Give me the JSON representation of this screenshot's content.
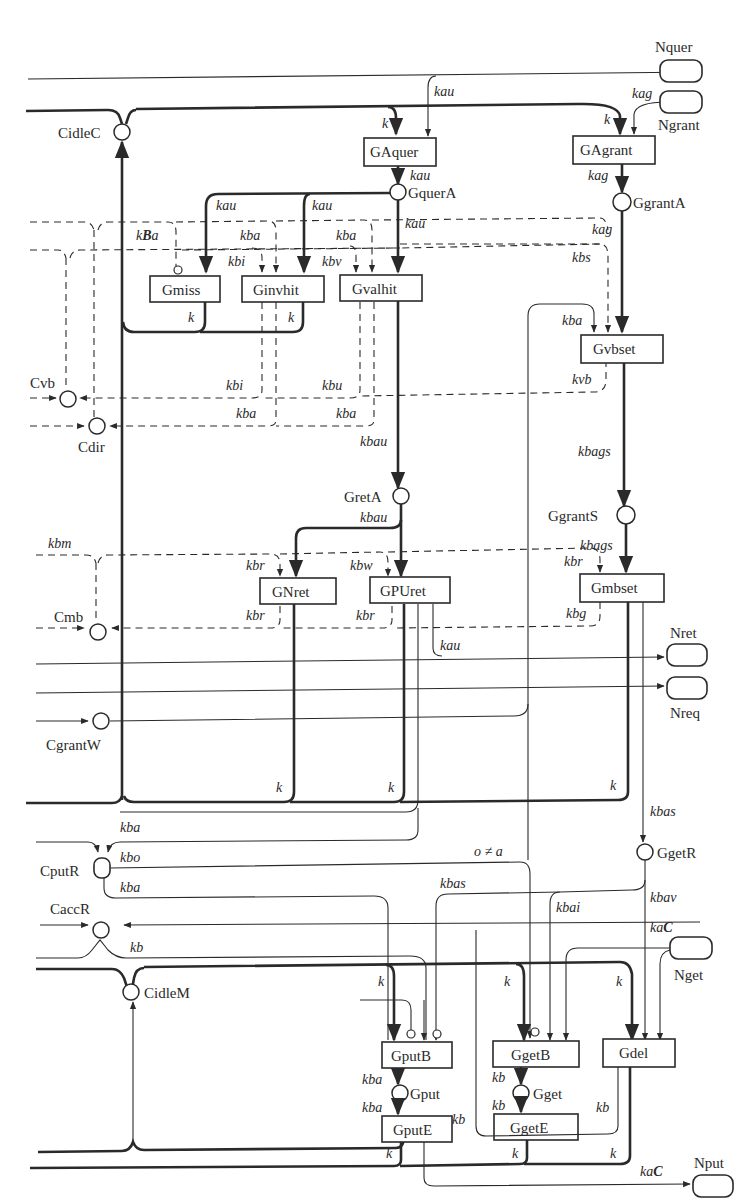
{
  "diagram": {
    "type": "petri-net",
    "places": {
      "CidleC": "CidleC",
      "GquerA": "GquerA",
      "GgrantA": "GgrantA",
      "Cvb": "Cvb",
      "Cdir": "Cdir",
      "GretA": "GretA",
      "GgrantS": "GgrantS",
      "Cmb": "Cmb",
      "CgrantW": "CgrantW",
      "CputR": "CputR",
      "CaccR": "CaccR",
      "CidleM": "CidleM",
      "GgetR": "GgetR",
      "Gput": "Gput",
      "Gget": "Gget"
    },
    "transitions": {
      "GAquer": "GAquer",
      "GAgrant": "GAgrant",
      "Gmiss": "Gmiss",
      "Ginvhit": "Ginvhit",
      "Gvalhit": "Gvalhit",
      "Gvbset": "Gvbset",
      "GNret": "GNret",
      "GPUret": "GPUret",
      "Gmbset": "Gmbset",
      "GputB": "GputB",
      "GgetB": "GgetB",
      "Gdel": "Gdel",
      "GputE": "GputE",
      "GgetE": "GgetE"
    },
    "ports": {
      "Nquer": "Nquer",
      "Ngrant": "Ngrant",
      "Nret": "Nret",
      "Nreq": "Nreq",
      "Nget": "Nget",
      "Nput": "Nput"
    },
    "arc_labels": {
      "kau": "kau",
      "kag": "kag",
      "k": "k",
      "kBa_k": "k",
      "kBa_B": "B",
      "kBa_a": "a",
      "kba": "kba",
      "kbi": "kbi",
      "kbv": "kbv",
      "kbs": "kbs",
      "kbu": "kbu",
      "kvb": "kvb",
      "kbau": "kbau",
      "kbags": "kbags",
      "kbm": "kbm",
      "kbr": "kbr",
      "kbw": "kbw",
      "kbg": "kbg",
      "kbas": "kbas",
      "kbo": "kbo",
      "kb": "kb",
      "o_neq_a": "o ≠ a",
      "kbai": "kbai",
      "kbav": "kbav",
      "kaC_ka": "ka",
      "kaC_C": "C"
    }
  }
}
